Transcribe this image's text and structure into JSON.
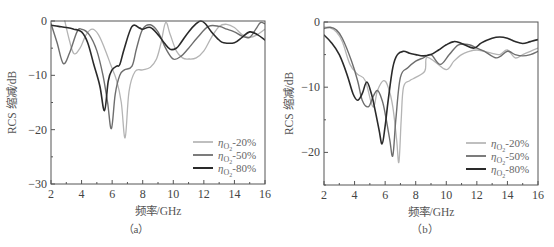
{
  "chart_data": [
    {
      "type": "line",
      "panel_label": "（a）",
      "title": "",
      "xlabel": "频率/GHz",
      "ylabel": "RCS 缩减/dB",
      "xlim": [
        2,
        16
      ],
      "ylim": [
        -30,
        0
      ],
      "xticks": [
        2,
        4,
        6,
        8,
        10,
        12,
        14,
        16
      ],
      "yticks": [
        0,
        -10,
        -20,
        -30
      ],
      "grid": false,
      "legend_position": "lower right",
      "series": [
        {
          "name": "ηO2-20%",
          "color": "#b4b4b4",
          "width": 1.3,
          "x": [
            2.9,
            3.2,
            3.5,
            3.9,
            4.3,
            4.7,
            5.1,
            5.5,
            5.9,
            6.3,
            6.6,
            6.85,
            7.1,
            7.5,
            8.0,
            8.5,
            8.9,
            9.2,
            9.5,
            9.8,
            10.2,
            10.6,
            11.0,
            11.5,
            12.0,
            12.5,
            13.0,
            13.5,
            14.0,
            14.5,
            15.0,
            15.5,
            16.0
          ],
          "y": [
            0,
            -3.5,
            -6,
            -5,
            -2.5,
            -1.5,
            -2.5,
            -5,
            -8,
            -11,
            -15,
            -21.5,
            -13,
            -9.3,
            -9,
            -8.5,
            -7,
            -4,
            -0.3,
            -2.5,
            -5.5,
            -6.8,
            -7,
            -6.8,
            -5.5,
            -3,
            -1,
            -0.6,
            -1.2,
            -2.5,
            -3,
            -2.5,
            -1.5
          ]
        },
        {
          "name": "ηO2-50%",
          "color": "#6e6e6e",
          "width": 1.4,
          "x": [
            2.0,
            2.4,
            2.8,
            3.2,
            3.7,
            4.0,
            4.5,
            5.0,
            5.4,
            5.7,
            5.95,
            6.2,
            6.5,
            6.8,
            7.3,
            7.6,
            8.0,
            8.5,
            9.0,
            9.5,
            10.0,
            10.5,
            11.0,
            11.6,
            12.3,
            13.0,
            13.5,
            14.0,
            14.5,
            15.0,
            15.4,
            15.7,
            16.0
          ],
          "y": [
            -0.5,
            -4,
            -7.8,
            -6,
            -2,
            -1.5,
            -2.5,
            -5.5,
            -10,
            -15,
            -19.8,
            -13.5,
            -10,
            -9,
            -8.3,
            -5,
            -1.5,
            -0.7,
            -2,
            -5,
            -7,
            -6.5,
            -5,
            -3,
            -1,
            -1,
            -1.5,
            -2,
            -2.8,
            -3,
            -1.5,
            -0.3,
            -0.5
          ]
        },
        {
          "name": "ηO2-80%",
          "color": "#2a2a2a",
          "width": 1.6,
          "x": [
            2.0,
            2.5,
            3.0,
            3.5,
            4.0,
            4.4,
            4.8,
            5.2,
            5.5,
            5.75,
            6.0,
            6.3,
            6.5,
            6.8,
            7.3,
            7.8,
            8.0,
            8.5,
            9.0,
            9.4,
            9.8,
            10.2,
            10.5,
            11.0,
            11.5,
            11.8,
            12.1,
            12.5,
            13.0,
            13.3,
            14.0,
            14.5,
            15.0,
            15.5,
            16.0
          ],
          "y": [
            -0.8,
            -1,
            -1.2,
            -1.5,
            -2,
            -4,
            -8,
            -12,
            -16.5,
            -11,
            -9,
            -8.3,
            -8,
            -5,
            -1,
            -1.3,
            -1.5,
            -1.2,
            -2.5,
            -4,
            -5.2,
            -5,
            -4,
            -2,
            -0.5,
            0,
            -0.5,
            -2,
            -3.5,
            -4,
            -4,
            -3,
            -2,
            -2.5,
            -3.5
          ]
        }
      ]
    },
    {
      "type": "line",
      "panel_label": "（b）",
      "title": "",
      "xlabel": "频率/GHz",
      "ylabel": "RCS 缩减/dB",
      "xlim": [
        2,
        16
      ],
      "ylim": [
        -25,
        0
      ],
      "xticks": [
        2,
        4,
        6,
        8,
        10,
        12,
        14,
        16
      ],
      "yticks": [
        0,
        -10,
        -20
      ],
      "grid": false,
      "legend_position": "lower right",
      "series": [
        {
          "name": "ηO2-20%",
          "color": "#b4b4b4",
          "width": 1.3,
          "x": [
            2.0,
            2.4,
            2.8,
            3.2,
            3.7,
            4.2,
            4.7,
            5.2,
            5.5,
            5.9,
            6.2,
            6.5,
            6.75,
            6.9,
            7.05,
            7.2,
            7.6,
            8.0,
            8.6,
            8.7,
            9.2,
            10.0,
            10.5,
            11.0,
            11.5,
            12.0,
            12.5,
            13.0,
            13.5,
            14.0,
            14.5,
            15.0,
            15.5,
            16.0
          ],
          "y": [
            -0.8,
            -0.9,
            -1.5,
            -3,
            -6.5,
            -8,
            -9,
            -13,
            -10.5,
            -9,
            -10,
            -13,
            -18,
            -21.5,
            -15,
            -10,
            -9,
            -8.5,
            -7.5,
            -5.5,
            -6,
            -7.3,
            -6,
            -5,
            -4.5,
            -4.3,
            -4.5,
            -4.8,
            -5,
            -4.3,
            -5.5,
            -5,
            -4.5,
            -4
          ]
        },
        {
          "name": "ηO2-50%",
          "color": "#6e6e6e",
          "width": 1.4,
          "x": [
            2.0,
            2.4,
            2.8,
            3.2,
            3.8,
            4.2,
            4.5,
            4.9,
            5.2,
            5.5,
            5.8,
            6.0,
            6.3,
            6.5,
            6.7,
            7.0,
            7.5,
            8.0,
            8.5,
            9.0,
            9.6,
            10.2,
            10.8,
            11.5,
            12.0,
            12.5,
            13.3,
            14.0,
            14.5,
            15.0,
            15.5,
            16.0
          ],
          "y": [
            -1,
            -0.8,
            -1.2,
            -2.5,
            -6,
            -9,
            -12,
            -13,
            -11.5,
            -10.5,
            -12,
            -14,
            -18,
            -20.5,
            -15,
            -8.5,
            -7,
            -6,
            -5.5,
            -5,
            -6.5,
            -5,
            -3.5,
            -3.5,
            -4,
            -4.5,
            -5.5,
            -4.5,
            -5,
            -5.2,
            -5,
            -4.5
          ]
        },
        {
          "name": "ηO2-80%",
          "color": "#2a2a2a",
          "width": 1.6,
          "x": [
            2.0,
            2.5,
            3.0,
            3.5,
            3.9,
            4.2,
            4.5,
            4.8,
            5.1,
            5.3,
            5.6,
            5.8,
            6.0,
            6.2,
            6.5,
            6.8,
            7.2,
            7.6,
            8.0,
            8.5,
            9.0,
            9.5,
            10.0,
            10.5,
            11.0,
            11.8,
            12.3,
            13.0,
            13.5,
            14.0,
            14.5,
            15.0,
            15.5,
            16.0
          ],
          "y": [
            -2,
            -3.2,
            -5,
            -8,
            -11,
            -12,
            -11,
            -9.2,
            -11,
            -13,
            -16.5,
            -18.7,
            -16,
            -12,
            -7,
            -5,
            -4.5,
            -4.8,
            -5,
            -5.2,
            -5,
            -4.3,
            -3.5,
            -3,
            -3.3,
            -4,
            -3.2,
            -2.5,
            -2.3,
            -2.5,
            -3,
            -3.3,
            -3,
            -2.7
          ]
        }
      ]
    }
  ],
  "panels": [
    {
      "id": "a",
      "label": "（a）",
      "ylabel": "RCS 缩减/dB",
      "xlabel": "频率/GHz",
      "legend": [
        "ηO2-20%",
        "ηO2-50%",
        "ηO2-80%"
      ]
    },
    {
      "id": "b",
      "label": "（b）",
      "ylabel": "RCS 缩减/dB",
      "xlabel": "频率/GHz",
      "legend": [
        "ηO2-20%",
        "ηO2-50%",
        "ηO2-80%"
      ]
    }
  ]
}
